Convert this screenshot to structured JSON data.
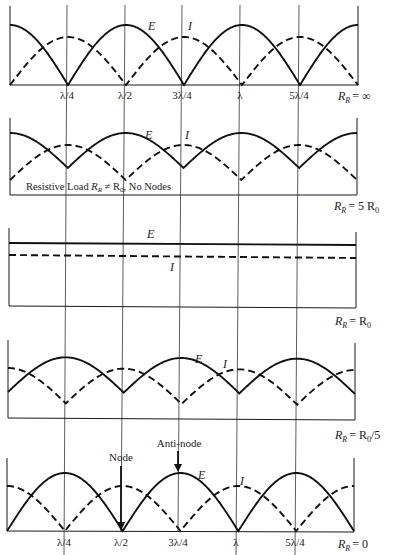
{
  "figure": {
    "legend": {
      "solid": "E",
      "dashed": "I"
    },
    "x_positions": [
      "0",
      "λ/4",
      "λ/2",
      "3λ/4",
      "λ",
      "5λ/4",
      "3λ/2"
    ],
    "tick_labels": [
      "λ/4",
      "λ/2",
      "3λ/4",
      "λ",
      "5λ/4"
    ]
  },
  "panels": [
    {
      "id": "open",
      "load_label": "R_R = ∞",
      "load_main": "R",
      "load_sub": "R",
      "load_rhs": "= ∞",
      "type": "abs",
      "E_phase": "max at 0, λ/2, λ; zero at λ/4, 3λ/4, 5λ/4",
      "I_phase": "zero at 0, λ/2, λ; max at λ/4, 3λ/4, 5λ/4",
      "E_amp": 1.0,
      "I_amp": 0.8,
      "E_label": "E",
      "I_label": "I"
    },
    {
      "id": "high-resistive",
      "load_label": "R_R = 5 R_0",
      "load_main": "R",
      "load_sub": "R",
      "load_rhs": "= 5 R",
      "load_rhs_sub": "0",
      "type": "resistive-high",
      "E_max": 1.0,
      "E_min": 0.2,
      "note": "Resistive Load R_R ≠ R_0, No Nodes",
      "note_parts": [
        "Resistive Load ",
        "R",
        "R",
        " ≠ R",
        "0",
        ", No Nodes"
      ],
      "E_label": "E",
      "I_label": "I"
    },
    {
      "id": "matched",
      "load_label": "R_R = R_0",
      "load_main": "R",
      "load_sub": "R",
      "load_rhs": "= R",
      "load_rhs_sub": "0",
      "type": "flat",
      "E_label": "E",
      "I_label": "I"
    },
    {
      "id": "low-resistive",
      "load_label": "R_R = R_0/5",
      "load_main": "R",
      "load_sub": "R",
      "load_rhs": "= R",
      "load_rhs_sub": "0",
      "load_rhs_tail": "/5",
      "type": "resistive-low",
      "E_label": "E",
      "I_label": "I"
    },
    {
      "id": "short",
      "load_label": "R_R = 0",
      "load_main": "R",
      "load_sub": "R",
      "load_rhs": "= 0",
      "type": "abs-short",
      "E_label": "E",
      "I_label": "I",
      "annotations": {
        "node": "Node",
        "antinode": "Anti-node"
      }
    }
  ]
}
